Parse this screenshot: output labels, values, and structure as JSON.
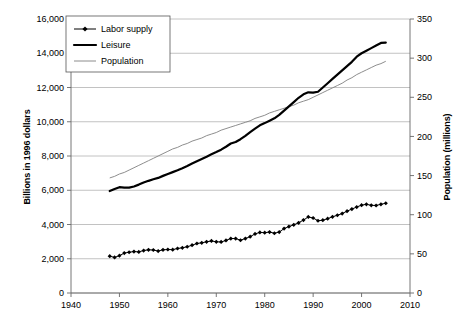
{
  "chart_data": {
    "type": "line",
    "title": "",
    "xlabel": "",
    "ylabel": "Billions in 1996 dollars",
    "y2label": "Population (millions)",
    "xlim": [
      1940,
      2010
    ],
    "ylim": [
      0,
      16000
    ],
    "y2lim": [
      0,
      350
    ],
    "grid": true,
    "legend_position": "top-left-inside",
    "x_ticks": [
      "1940",
      "1950",
      "1960",
      "1970",
      "1980",
      "1990",
      "2000",
      "2010"
    ],
    "x_tick_values": [
      1940,
      1950,
      1960,
      1970,
      1980,
      1990,
      2000,
      2010
    ],
    "y_ticks": [
      "0",
      "2,000",
      "4,000",
      "6,000",
      "8,000",
      "10,000",
      "12,000",
      "14,000",
      "16,000"
    ],
    "y_tick_values": [
      0,
      2000,
      4000,
      6000,
      8000,
      10000,
      12000,
      14000,
      16000
    ],
    "y2_ticks": [
      "0",
      "50",
      "100",
      "150",
      "200",
      "250",
      "300",
      "350"
    ],
    "y2_tick_values": [
      0,
      50,
      100,
      150,
      200,
      250,
      300,
      350
    ],
    "legend": [
      "Labor supply",
      "Leisure",
      "Population"
    ],
    "x": [
      1948,
      1949,
      1950,
      1951,
      1952,
      1953,
      1954,
      1955,
      1956,
      1957,
      1958,
      1959,
      1960,
      1961,
      1962,
      1963,
      1964,
      1965,
      1966,
      1967,
      1968,
      1969,
      1970,
      1971,
      1972,
      1973,
      1974,
      1975,
      1976,
      1977,
      1978,
      1979,
      1980,
      1981,
      1982,
      1983,
      1984,
      1985,
      1986,
      1987,
      1988,
      1989,
      1990,
      1991,
      1992,
      1993,
      1994,
      1995,
      1996,
      1997,
      1998,
      1999,
      2000,
      2001,
      2002,
      2003,
      2004,
      2005
    ],
    "series": [
      {
        "name": "Labor supply",
        "axis": "left",
        "units": "Billions in 1996 dollars",
        "marker": "diamond",
        "values": [
          2150,
          2080,
          2180,
          2330,
          2380,
          2420,
          2400,
          2480,
          2520,
          2510,
          2450,
          2520,
          2540,
          2530,
          2600,
          2640,
          2700,
          2790,
          2890,
          2930,
          2990,
          3040,
          2990,
          2980,
          3070,
          3180,
          3180,
          3080,
          3180,
          3290,
          3450,
          3540,
          3520,
          3560,
          3490,
          3560,
          3760,
          3880,
          3980,
          4100,
          4260,
          4440,
          4380,
          4220,
          4250,
          4340,
          4450,
          4540,
          4640,
          4780,
          4900,
          5020,
          5130,
          5180,
          5120,
          5110,
          5180,
          5240
        ]
      },
      {
        "name": "Leisure",
        "axis": "left",
        "units": "Billions in 1996 dollars",
        "marker": "none",
        "values": [
          5950,
          6070,
          6180,
          6150,
          6150,
          6220,
          6330,
          6450,
          6550,
          6640,
          6720,
          6840,
          6950,
          7060,
          7170,
          7290,
          7420,
          7560,
          7700,
          7830,
          7960,
          8100,
          8230,
          8370,
          8540,
          8730,
          8820,
          8980,
          9180,
          9400,
          9600,
          9790,
          9920,
          10060,
          10200,
          10400,
          10650,
          10900,
          11150,
          11400,
          11600,
          11720,
          11700,
          11750,
          12000,
          12250,
          12500,
          12750,
          13000,
          13250,
          13500,
          13800,
          14000,
          14150,
          14300,
          14450,
          14600,
          14620
        ]
      },
      {
        "name": "Population",
        "axis": "right",
        "units": "millions",
        "marker": "none",
        "values": [
          147,
          149,
          152,
          154,
          157,
          160,
          163,
          166,
          169,
          172,
          175,
          178,
          181,
          184,
          186,
          189,
          191,
          194,
          196,
          198,
          201,
          203,
          205,
          208,
          210,
          212,
          214,
          216,
          218,
          220,
          223,
          225,
          227,
          230,
          232,
          234,
          236,
          238,
          240,
          243,
          245,
          247,
          250,
          253,
          256,
          259,
          262,
          265,
          268,
          272,
          275,
          279,
          282,
          285,
          288,
          291,
          293,
          296
        ]
      }
    ]
  }
}
